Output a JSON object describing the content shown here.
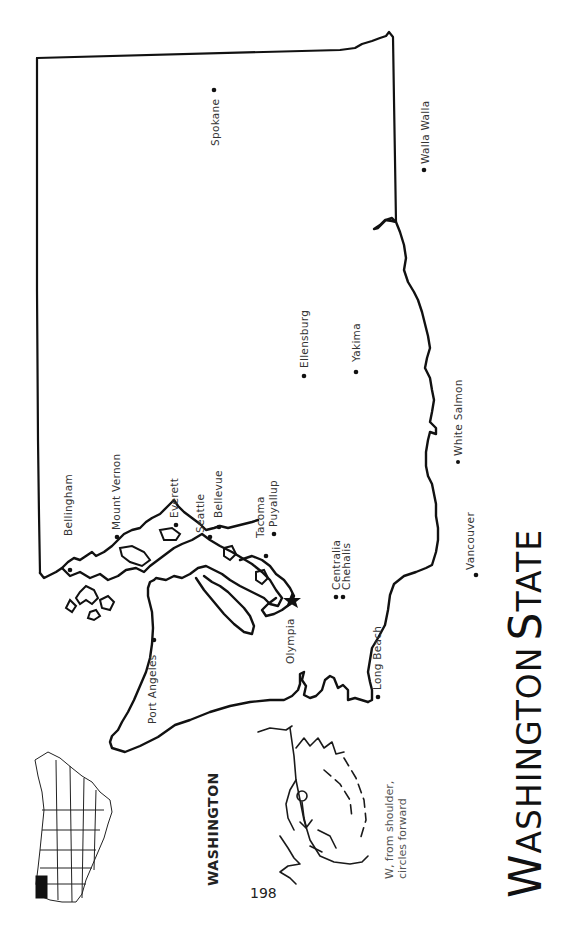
{
  "page": {
    "title_first_word_cap": "W",
    "title_first_word_rest": "ASHINGTON",
    "title_second_word_cap": "S",
    "title_second_word_rest": "TATE",
    "state_name": "WASHINGTON",
    "page_number": "198",
    "sign_description_line1": "W, from shoulder,",
    "sign_description_line2": "circles forward",
    "orientation": "rotated 90° counter-clockwise"
  },
  "map": {
    "capital_symbol": "star-icon",
    "capital": "Olympia",
    "cities": [
      {
        "name": "Spokane"
      },
      {
        "name": "Walla Walla"
      },
      {
        "name": "Ellensburg"
      },
      {
        "name": "Yakima"
      },
      {
        "name": "White Salmon"
      },
      {
        "name": "Vancouver"
      },
      {
        "name": "Bellingham"
      },
      {
        "name": "Mount Vernon"
      },
      {
        "name": "Everett"
      },
      {
        "name": "Seattle"
      },
      {
        "name": "Bellevue"
      },
      {
        "name": "Tacoma"
      },
      {
        "name": "Puyallup"
      },
      {
        "name": "Centralia"
      },
      {
        "name": "Chehalis"
      },
      {
        "name": "Olympia"
      },
      {
        "name": "Long Beach"
      },
      {
        "name": "Port Angeles"
      }
    ]
  },
  "inset": {
    "description": "Map of United States with Washington highlighted",
    "highlight_color": "#111111"
  }
}
